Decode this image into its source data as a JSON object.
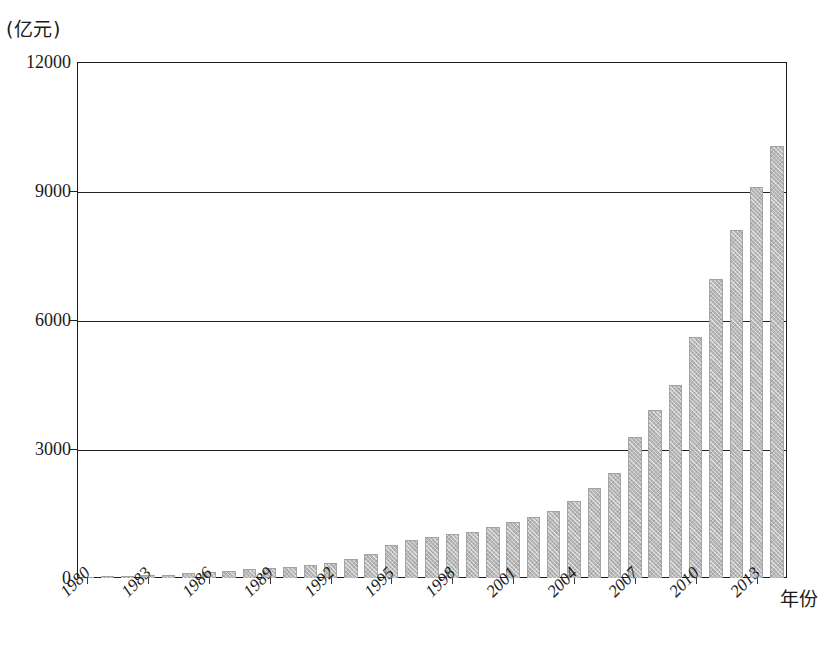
{
  "chart_data": {
    "type": "bar",
    "title": "",
    "subtitle": "",
    "unit_caption": "(亿元)",
    "xlabel": "年份",
    "ylabel": "",
    "ylim": [
      0,
      12000
    ],
    "y_ticks": [
      0,
      3000,
      6000,
      9000,
      12000
    ],
    "y_tick_labels": [
      "0",
      "3000",
      "6000",
      "9000",
      "12000"
    ],
    "grid": true,
    "grid_axis": "y",
    "legend": false,
    "legend_position": "none",
    "bar_color": "#b9b9b9",
    "axis_color": "#1c1c1c",
    "x_tick_step": 3,
    "x_tick_labels": [
      "1980",
      "1983",
      "1986",
      "1989",
      "1992",
      "1995",
      "1998",
      "2001",
      "2004",
      "2007",
      "2010",
      "2013"
    ],
    "categories": [
      "1980",
      "1981",
      "1982",
      "1983",
      "1984",
      "1985",
      "1986",
      "1987",
      "1988",
      "1989",
      "1990",
      "1991",
      "1992",
      "1993",
      "1994",
      "1995",
      "1996",
      "1997",
      "1998",
      "1999",
      "2000",
      "2001",
      "2002",
      "2003",
      "2004",
      "2005",
      "2006",
      "2007",
      "2008",
      "2009",
      "2010",
      "2011",
      "2012",
      "2013",
      "2014"
    ],
    "values": [
      30,
      40,
      50,
      60,
      80,
      110,
      150,
      170,
      200,
      230,
      260,
      300,
      340,
      440,
      560,
      760,
      880,
      960,
      1030,
      1080,
      1180,
      1300,
      1420,
      1570,
      1790,
      2090,
      2450,
      3280,
      3900,
      4500,
      5600,
      6950,
      8100,
      9100,
      10050
    ]
  }
}
